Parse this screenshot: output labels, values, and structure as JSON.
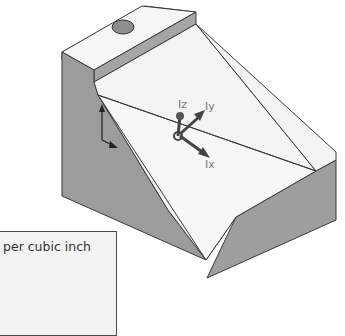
{
  "viewport": {
    "model": "isometric-part",
    "triad_labels": {
      "z": "Iz",
      "y": "Iy",
      "x": "Ix"
    },
    "colors": {
      "light_face": "#f4f4f4",
      "dark_face": "#9a9a9a",
      "mid_face": "#b8b8b8",
      "edge": "#3a3a3a",
      "hole": "#8a8a8a"
    }
  },
  "properties_box": {
    "text": "per cubic inch"
  }
}
